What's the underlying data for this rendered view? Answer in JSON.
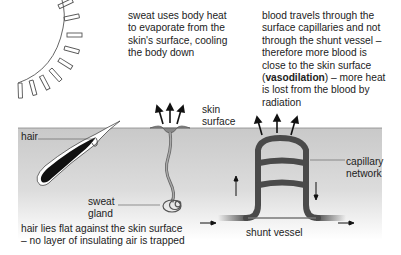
{
  "diagram": {
    "annotations": {
      "sweat_caption": [
        "sweat uses body heat",
        "to evaporate from the",
        "skin's surface, cooling",
        "the body down"
      ],
      "blood_caption": {
        "lines_before": [
          "blood travels through the",
          "surface capillaries and not",
          "through the shunt vessel –",
          "therefore more blood is",
          "close to the skin surface"
        ],
        "bold_term": "vasodilation",
        "paren_open": "(",
        "paren_close_rest": ") – more heat",
        "lines_after": [
          "is lost from the blood by",
          "radiation"
        ]
      },
      "hair_caption": [
        "hair lies flat against the skin surface",
        "– no layer of insulating air is trapped"
      ]
    },
    "labels": {
      "hair": "hair",
      "sweat_gland": [
        "sweat",
        "gland"
      ],
      "skin_surface": [
        "skin",
        "surface"
      ],
      "capillary_network": [
        "capillary",
        "network"
      ],
      "shunt_vessel": "shunt vessel"
    },
    "icons": {
      "sun": "sun-icon",
      "heat_arrows": "heat-radiation-arrows",
      "flow_arrows": "blood-flow-arrows"
    },
    "colors": {
      "skin_top": "#cfcfcf",
      "skin_bottom": "#ffffff",
      "vessel": "#4a4a4a",
      "hair": "#111111",
      "text": "#222222"
    }
  }
}
